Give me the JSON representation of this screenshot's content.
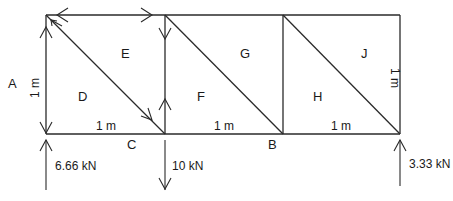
{
  "diagram": {
    "type": "truss-free-body-diagram",
    "space_labels": {
      "A": "A",
      "B": "B",
      "C": "C",
      "D": "D",
      "E": "E",
      "F": "F",
      "G": "G",
      "H": "H",
      "J": "J"
    },
    "dimensions": {
      "left_height": "1 m",
      "right_height": "1 m",
      "panel_1_width": "1 m",
      "panel_2_width": "1 m",
      "panel_3_width": "1 m"
    },
    "loads": {
      "left_reaction": "6.66 kN",
      "applied_load": "10 kN",
      "right_reaction": "3.33 kN"
    },
    "panels": 3
  }
}
